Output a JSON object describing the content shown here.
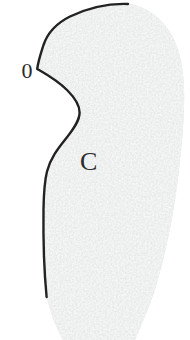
{
  "figure": {
    "labels": {
      "origin": "0",
      "curve": "C"
    },
    "colors": {
      "background": "#ffffff",
      "region_fill": "#e2e3e3",
      "curve_stroke": "#222222",
      "label_color": "#2a2a2a"
    }
  }
}
